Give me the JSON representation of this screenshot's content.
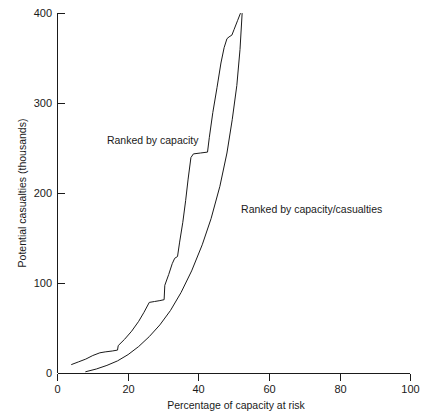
{
  "chart_data": {
    "type": "line",
    "title": "",
    "xlabel": "Percentage of capacity at risk",
    "ylabel": "Potential casualties (thousands)",
    "xlim": [
      0,
      100
    ],
    "ylim": [
      0,
      400
    ],
    "xticks": [
      0,
      20,
      40,
      60,
      80,
      100
    ],
    "xtick_labels": [
      "0",
      "20",
      "40",
      "60",
      "80",
      "100"
    ],
    "yticks": [
      0,
      100,
      200,
      300,
      400
    ],
    "ytick_labels": [
      "0",
      "100",
      "200",
      "300",
      "400"
    ],
    "grid": false,
    "legend_position": "inline-annotations",
    "series": [
      {
        "name": "Ranked by capacity",
        "label_text": "Ranked by capacity",
        "points": [
          [
            4.0,
            10
          ],
          [
            6.0,
            13
          ],
          [
            8.0,
            16
          ],
          [
            10.0,
            20
          ],
          [
            12.0,
            23
          ],
          [
            13.5,
            24
          ],
          [
            15.5,
            25
          ],
          [
            17.0,
            26
          ],
          [
            17.2,
            31
          ],
          [
            19.0,
            38
          ],
          [
            21.0,
            47
          ],
          [
            23.0,
            58
          ],
          [
            24.5,
            68
          ],
          [
            26.0,
            79
          ],
          [
            27.5,
            80
          ],
          [
            29.0,
            81
          ],
          [
            30.2,
            82
          ],
          [
            30.4,
            98
          ],
          [
            31.5,
            110
          ],
          [
            32.5,
            122
          ],
          [
            33.2,
            128
          ],
          [
            34.0,
            130
          ],
          [
            34.6,
            146
          ],
          [
            35.5,
            168
          ],
          [
            36.3,
            192
          ],
          [
            37.0,
            216
          ],
          [
            37.8,
            240
          ],
          [
            38.5,
            244
          ],
          [
            40.5,
            245
          ],
          [
            42.5,
            246
          ],
          [
            43.0,
            262
          ],
          [
            44.0,
            290
          ],
          [
            45.2,
            318
          ],
          [
            46.3,
            345
          ],
          [
            47.2,
            362
          ],
          [
            48.0,
            372
          ],
          [
            48.6,
            374
          ],
          [
            49.4,
            376
          ],
          [
            50.0,
            382
          ],
          [
            51.0,
            392
          ],
          [
            51.8,
            400
          ]
        ]
      },
      {
        "name": "Ranked by capacity/casualties",
        "label_text": "Ranked by capacity/casualties",
        "points": [
          [
            8.0,
            2
          ],
          [
            11.0,
            5
          ],
          [
            14.0,
            9
          ],
          [
            17.0,
            14
          ],
          [
            20.0,
            21
          ],
          [
            23.0,
            30
          ],
          [
            26.0,
            41
          ],
          [
            29.0,
            54
          ],
          [
            32.0,
            70
          ],
          [
            35.0,
            90
          ],
          [
            38.0,
            114
          ],
          [
            41.0,
            143
          ],
          [
            43.5,
            172
          ],
          [
            46.0,
            208
          ],
          [
            48.0,
            245
          ],
          [
            49.5,
            282
          ],
          [
            50.8,
            320
          ],
          [
            51.7,
            360
          ],
          [
            52.3,
            400
          ]
        ]
      }
    ],
    "annotations": [
      {
        "text": "Ranked by capacity",
        "x_pct": 14.0,
        "y_value": 255
      },
      {
        "text": "Ranked by capacity/casualties",
        "x_pct": 52.0,
        "y_value": 178
      }
    ]
  }
}
